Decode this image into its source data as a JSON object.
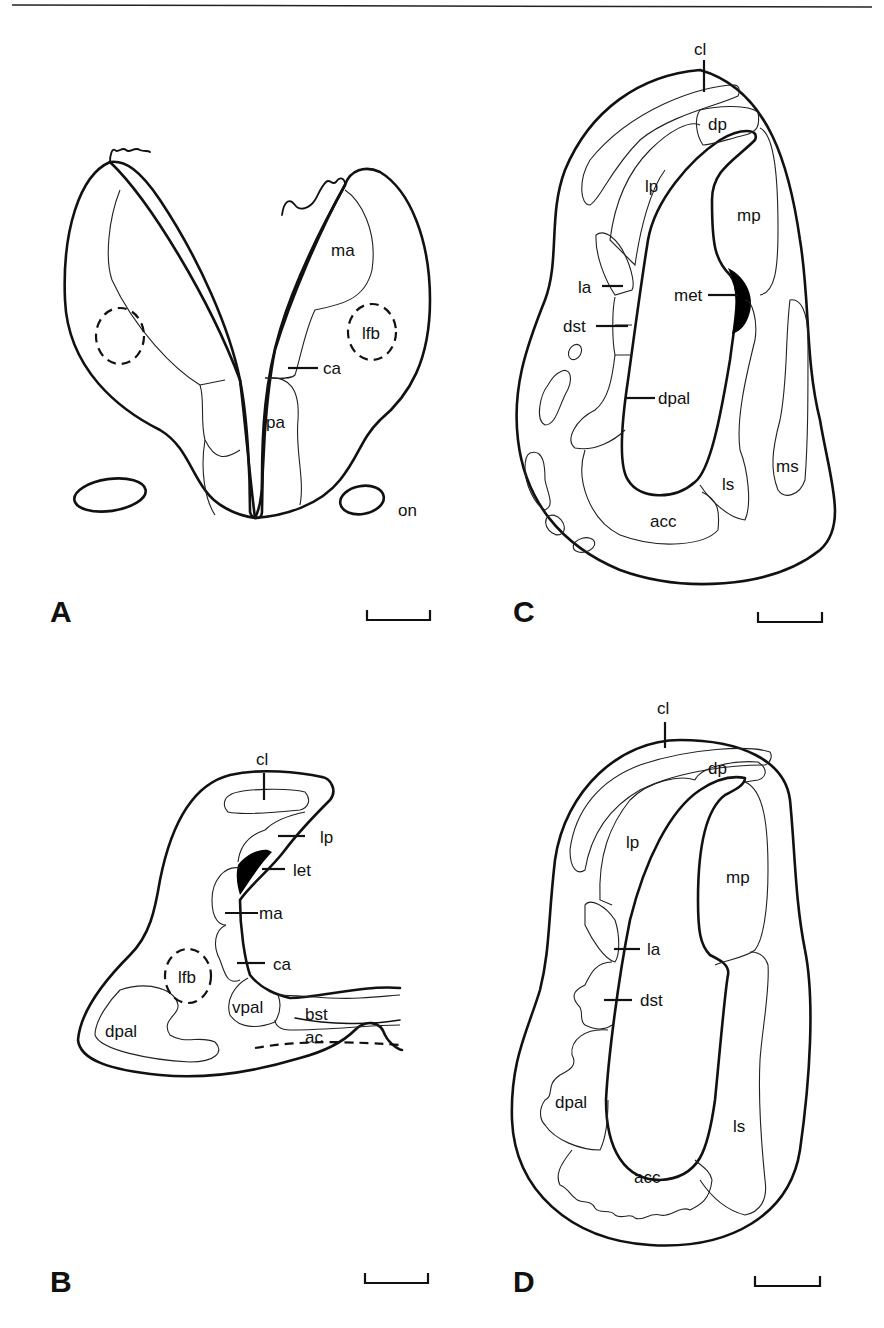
{
  "figure": {
    "type": "neuroanatomical line drawings, four coronal sections",
    "panels": [
      {
        "id": "A",
        "label": "A",
        "regions": [
          "ma",
          "lfb",
          "ca",
          "pa",
          "on"
        ]
      },
      {
        "id": "B",
        "label": "B",
        "regions": [
          "cl",
          "lp",
          "let",
          "ma",
          "ca",
          "lfb",
          "vpal",
          "bst",
          "dpal",
          "ac"
        ]
      },
      {
        "id": "C",
        "label": "C",
        "regions": [
          "cl",
          "dp",
          "lp",
          "mp",
          "la",
          "met",
          "dst",
          "dpal",
          "ms",
          "ls",
          "acc"
        ]
      },
      {
        "id": "D",
        "label": "D",
        "regions": [
          "cl",
          "dp",
          "lp",
          "mp",
          "la",
          "dst",
          "dpal",
          "ls",
          "acc"
        ]
      }
    ],
    "scale_bar": "present in each panel (no value shown)"
  }
}
